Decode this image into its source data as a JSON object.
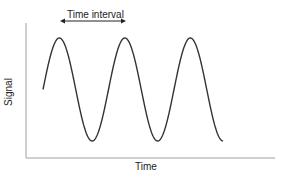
{
  "chart_data": {
    "type": "line",
    "title": "",
    "annotation": "Time interval",
    "xlabel": "Time",
    "ylabel": "Signal",
    "grid": false,
    "legend": null,
    "series": [
      {
        "name": "Signal",
        "shape": "sine",
        "cycles": 2.75,
        "start_phase": "zero-crossing rising",
        "peaks": 3,
        "troughs": 3
      }
    ],
    "ticks": {
      "x": [],
      "y": []
    }
  },
  "labels": {
    "interval": "Time interval",
    "x_axis": "Time",
    "y_axis": "Signal"
  },
  "colors": {
    "line": "#333333",
    "axis": "#999999",
    "text": "#222222"
  }
}
